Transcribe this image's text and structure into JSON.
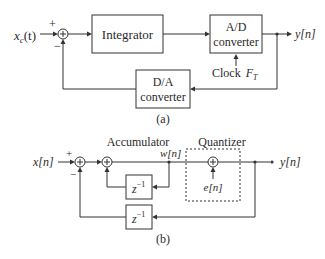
{
  "diagram_a": {
    "input_label": "x",
    "input_sub": "c",
    "input_arg": "(t)",
    "plus_sign": "+",
    "minus_sign": "−",
    "integrator_label": "Integrator",
    "ad_line1": "A/D",
    "ad_line2": "converter",
    "output_label": "y[n]",
    "clock_label": "Clock",
    "clock_var": "F",
    "clock_sub": "T",
    "da_line1": "D/A",
    "da_line2": "converter",
    "caption": "(a)"
  },
  "diagram_b": {
    "input_label": "x[n]",
    "plus_sign": "+",
    "minus_sign": "−",
    "accumulator_label": "Accumulator",
    "quantizer_label": "Quantizer",
    "w_label": "w[n]",
    "e_label": "e[n]",
    "output_label": "y[n]",
    "delay1_base": "z",
    "delay1_exp": "−1",
    "delay2_base": "z",
    "delay2_exp": "−1",
    "caption": "(b)"
  }
}
